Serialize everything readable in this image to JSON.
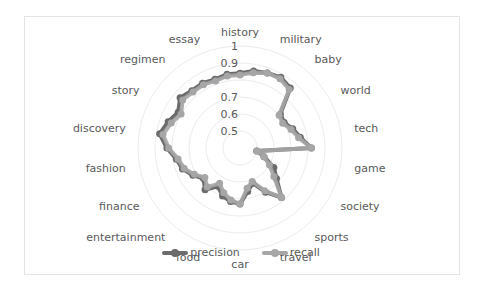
{
  "chart_data": {
    "type": "radar",
    "title": "",
    "categories": [
      "history",
      "",
      "military",
      "",
      "baby",
      "",
      "world",
      "",
      "tech",
      "",
      "game",
      "",
      "society",
      "",
      "sports",
      "",
      "travel",
      "",
      "car",
      "",
      "food",
      "",
      "entertainment",
      "",
      "finance",
      "",
      "fashion",
      "",
      "discovery",
      "",
      "story",
      "",
      "regimen",
      "",
      "essay",
      ""
    ],
    "tick_labels": [
      "0.5",
      "0.6",
      "0.7",
      "0.9",
      "1"
    ],
    "rlim": [
      0.4,
      1.0
    ],
    "series": [
      {
        "name": "precision",
        "color": "#6b6b6b",
        "values": [
          0.84,
          0.86,
          0.87,
          0.88,
          0.86,
          0.71,
          0.7,
          0.73,
          0.76,
          0.82,
          0.5,
          0.55,
          0.63,
          0.68,
          0.78,
          0.7,
          0.62,
          0.66,
          0.73,
          0.72,
          0.7,
          0.66,
          0.72,
          0.68,
          0.72,
          0.76,
          0.78,
          0.83,
          0.88,
          0.85,
          0.82,
          0.86,
          0.84,
          0.84,
          0.83,
          0.84
        ]
      },
      {
        "name": "recall",
        "color": "#a6a6a6",
        "values": [
          0.83,
          0.85,
          0.87,
          0.87,
          0.85,
          0.7,
          0.69,
          0.72,
          0.75,
          0.82,
          0.5,
          0.55,
          0.6,
          0.66,
          0.78,
          0.69,
          0.61,
          0.64,
          0.73,
          0.71,
          0.68,
          0.64,
          0.7,
          0.67,
          0.71,
          0.75,
          0.77,
          0.82,
          0.86,
          0.83,
          0.8,
          0.84,
          0.83,
          0.83,
          0.82,
          0.83
        ]
      }
    ],
    "legend_position": "bottom",
    "grid": true
  },
  "legend": {
    "items": [
      {
        "label": "precision",
        "color": "#6b6b6b"
      },
      {
        "label": "recall",
        "color": "#a6a6a6"
      }
    ]
  }
}
